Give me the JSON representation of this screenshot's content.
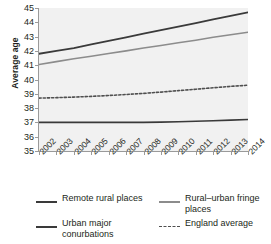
{
  "chart_data": {
    "type": "line",
    "title": "",
    "xlabel": "",
    "ylabel": "Average age",
    "ylim": [
      35,
      45
    ],
    "ytick_step": 1,
    "yticks": [
      45,
      44,
      43,
      42,
      41,
      40,
      39,
      38,
      37,
      36,
      35
    ],
    "grid": false,
    "legend_position": "bottom",
    "categories": [
      "2002",
      "2003",
      "2004",
      "2005",
      "2006",
      "2007",
      "2008",
      "2009",
      "2010",
      "2011",
      "2012",
      "2013",
      "2014"
    ],
    "x": [
      2002,
      2003,
      2004,
      2005,
      2006,
      2007,
      2008,
      2009,
      2010,
      2011,
      2012,
      2013,
      2014
    ],
    "series": [
      {
        "name": "Remote rural places",
        "style": "solid",
        "color": "#3a3a3a",
        "width": 1.8,
        "values": [
          41.8,
          42.0,
          42.2,
          42.45,
          42.7,
          42.95,
          43.2,
          43.45,
          43.7,
          43.95,
          44.2,
          44.45,
          44.7
        ]
      },
      {
        "name": "Rural–urban fringe places",
        "style": "solid",
        "color": "#8c8c8c",
        "width": 1.6,
        "values": [
          41.05,
          41.25,
          41.45,
          41.63,
          41.82,
          42.0,
          42.2,
          42.38,
          42.57,
          42.75,
          42.95,
          43.13,
          43.3
        ]
      },
      {
        "name": "England average",
        "style": "dashed",
        "color": "#4f4f4f",
        "width": 1.6,
        "values": [
          38.7,
          38.73,
          38.77,
          38.82,
          38.88,
          38.95,
          39.03,
          39.12,
          39.22,
          39.32,
          39.42,
          39.52,
          39.6
        ]
      },
      {
        "name": "Urban major conurbations",
        "style": "solid",
        "color": "#3a3a3a",
        "width": 1.6,
        "values": [
          37.0,
          37.0,
          37.0,
          37.0,
          37.0,
          37.0,
          37.0,
          37.02,
          37.05,
          37.08,
          37.12,
          37.16,
          37.2
        ]
      }
    ]
  },
  "axes": {
    "y_title": "Average age",
    "y_tick_labels": [
      "45",
      "44",
      "43",
      "42",
      "41",
      "40",
      "39",
      "38",
      "37",
      "36",
      "35"
    ],
    "x_tick_labels": [
      "2002",
      "2003",
      "2004",
      "2005",
      "2006",
      "2007",
      "2008",
      "2009",
      "2010",
      "2011",
      "2012",
      "2013",
      "2014"
    ]
  },
  "legend": {
    "entries": [
      {
        "label": "Remote rural places",
        "style": "solid",
        "color": "#3a3a3a"
      },
      {
        "label": "Rural–urban fringe places",
        "style": "solid",
        "color": "#8c8c8c"
      },
      {
        "label": "Urban major conurbations",
        "style": "solid",
        "color": "#3a3a3a"
      },
      {
        "label": "England average",
        "style": "dashed",
        "color": "#4f4f4f"
      }
    ]
  },
  "colors": {
    "plot_background": "#f1f1f1",
    "page_background": "#ffffff",
    "axis": "#9a9a9a",
    "text": "#231f20"
  }
}
